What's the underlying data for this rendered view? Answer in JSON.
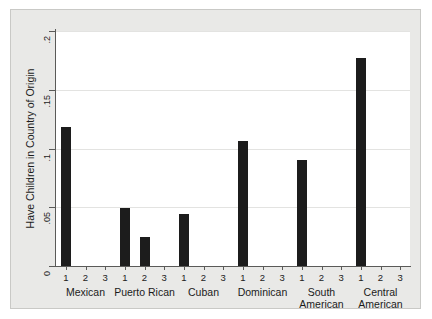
{
  "chart_data": {
    "type": "bar",
    "title": "",
    "xlabel": "",
    "ylabel": "Have Children in Country of Origin",
    "ylim": [
      0,
      0.2
    ],
    "ytick_labels": [
      "0",
      ".05",
      ".1",
      ".15",
      ".2"
    ],
    "ytick_values": [
      0,
      0.05,
      0.1,
      0.15,
      0.2
    ],
    "grid": true,
    "legend": "none",
    "group_labels": [
      "Mexican",
      "Puerto Rican",
      "Cuban",
      "Dominican",
      "South American",
      "Central American"
    ],
    "within_group_tick_labels": [
      "1",
      "2",
      "3"
    ],
    "groups": [
      {
        "name": "Mexican",
        "bars": [
          {
            "tick": "1",
            "value": 0.118
          },
          {
            "tick": "2",
            "value": 0
          },
          {
            "tick": "3",
            "value": 0
          }
        ]
      },
      {
        "name": "Puerto Rican",
        "bars": [
          {
            "tick": "1",
            "value": 0.049
          },
          {
            "tick": "2",
            "value": 0.025
          },
          {
            "tick": "3",
            "value": 0
          }
        ]
      },
      {
        "name": "Cuban",
        "bars": [
          {
            "tick": "1",
            "value": 0.044
          },
          {
            "tick": "2",
            "value": 0
          },
          {
            "tick": "3",
            "value": 0
          }
        ]
      },
      {
        "name": "Dominican",
        "bars": [
          {
            "tick": "1",
            "value": 0.106
          },
          {
            "tick": "2",
            "value": 0
          },
          {
            "tick": "3",
            "value": 0
          }
        ]
      },
      {
        "name": "South American",
        "bars": [
          {
            "tick": "1",
            "value": 0.09
          },
          {
            "tick": "2",
            "value": 0
          },
          {
            "tick": "3",
            "value": 0
          }
        ]
      },
      {
        "name": "Central American",
        "bars": [
          {
            "tick": "1",
            "value": 0.177
          },
          {
            "tick": "2",
            "value": 0
          },
          {
            "tick": "3",
            "value": 0
          }
        ]
      }
    ],
    "colors": {
      "bar": "#1c1c1c",
      "background": "#ffffff",
      "frame": "#e9e9e7",
      "frame_border": "#c9c9c6",
      "grid": "#e3e3e1",
      "axis": "#5a5a58",
      "text": "#1b1b1b"
    }
  }
}
